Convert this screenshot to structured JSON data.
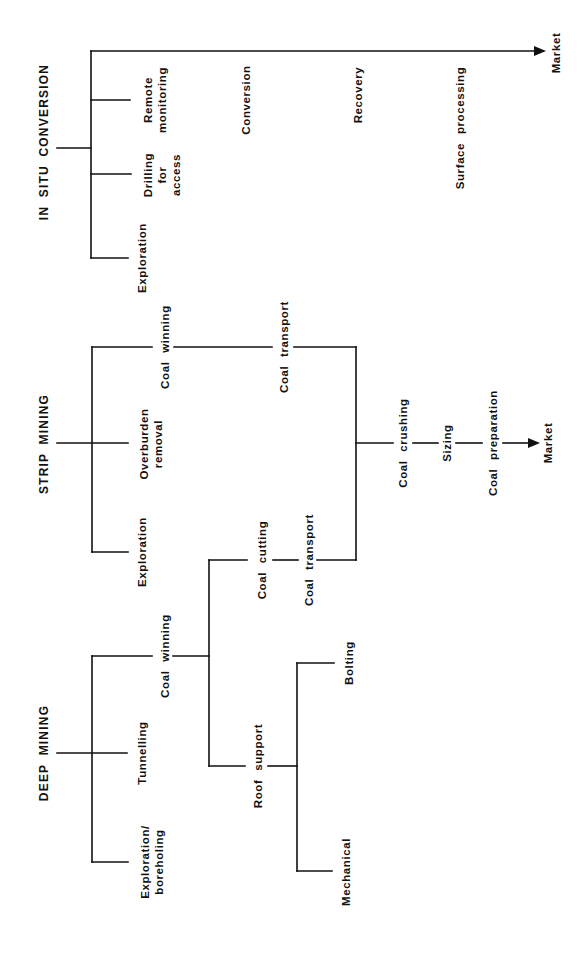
{
  "diagram": {
    "orientation": "rotated-90-ccw",
    "line_color": "#111111",
    "sections": {
      "in_situ": {
        "title": "IN SITU CONVERSION",
        "steps": [
          "Exploration",
          "Drilling\nfor\naccess",
          "Remote\nmonitoring"
        ],
        "stages": [
          "Conversion",
          "Recovery",
          "Surface processing"
        ],
        "end": "Market"
      },
      "strip": {
        "title": "STRIP MINING",
        "steps": [
          "Exploration",
          "Overburden\nremoval",
          "Coal winning"
        ],
        "transport": "Coal transport"
      },
      "deep": {
        "title": "DEEP MINING",
        "steps": [
          "Exploration/\nboreholing",
          "Tunnelling",
          "Coal winning"
        ],
        "coal_cutting": "Coal cutting",
        "transport": "Coal transport",
        "roof_support": "Roof support",
        "roof_options": [
          "Bolting",
          "Mechanical"
        ]
      },
      "processing": {
        "chain": [
          "Coal crushing",
          "Sizing",
          "Coal preparation"
        ],
        "end": "Market"
      }
    },
    "nodes": [
      {
        "id": "insitu-title",
        "text_path": "diagram.sections.in_situ.title",
        "x": 44,
        "y": 142
      },
      {
        "id": "insitu-remote",
        "x": 155,
        "y": 100
      },
      {
        "id": "insitu-drilling",
        "x": 162,
        "y": 175
      },
      {
        "id": "insitu-exploration",
        "x": 142,
        "y": 258
      },
      {
        "id": "insitu-conversion",
        "x": 246,
        "y": 100
      },
      {
        "id": "insitu-recovery",
        "x": 358,
        "y": 95
      },
      {
        "id": "insitu-surface",
        "x": 460,
        "y": 128
      },
      {
        "id": "insitu-market",
        "x": 555,
        "y": 53
      },
      {
        "id": "strip-title",
        "x": 44,
        "y": 444
      },
      {
        "id": "strip-overburden",
        "x": 151,
        "y": 444
      },
      {
        "id": "strip-exploration",
        "x": 142,
        "y": 552
      },
      {
        "id": "strip-coalwinning",
        "x": 165,
        "y": 347
      },
      {
        "id": "strip-transport",
        "x": 284,
        "y": 347
      },
      {
        "id": "deep-coalcutting",
        "x": 262,
        "y": 560
      },
      {
        "id": "deep-transport",
        "x": 312,
        "y": 560
      },
      {
        "id": "proc-crushing",
        "x": 403,
        "y": 443
      },
      {
        "id": "proc-sizing",
        "x": 448,
        "y": 443
      },
      {
        "id": "proc-preparation",
        "x": 493,
        "y": 443
      },
      {
        "id": "proc-market",
        "x": 547,
        "y": 443
      },
      {
        "id": "deep-title",
        "x": 44,
        "y": 753
      },
      {
        "id": "deep-tunnelling",
        "x": 142,
        "y": 753
      },
      {
        "id": "deep-exploration",
        "x": 152,
        "y": 862
      },
      {
        "id": "deep-coalwinning",
        "x": 165,
        "y": 656
      },
      {
        "id": "deep-roofsupport",
        "x": 262,
        "y": 766
      },
      {
        "id": "deep-bolting",
        "x": 350,
        "y": 663
      },
      {
        "id": "deep-mechanical",
        "x": 347,
        "y": 872
      }
    ]
  }
}
